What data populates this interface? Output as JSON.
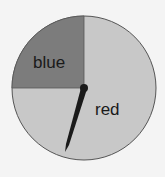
{
  "spinner": {
    "sections": [
      {
        "label": "blue",
        "fraction": 0.25,
        "color": "#7c7c7c"
      },
      {
        "label": "red",
        "fraction": 0.75,
        "color": "#c8c8c8"
      }
    ],
    "pointer_color": "#1a1a1a"
  }
}
